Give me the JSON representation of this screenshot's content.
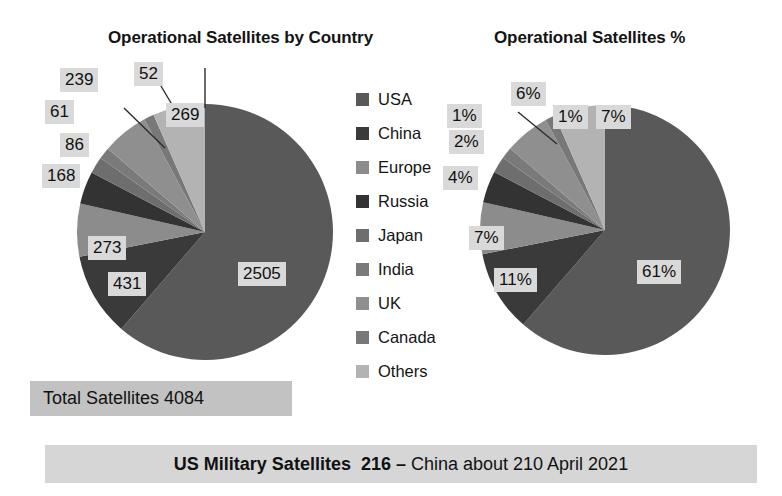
{
  "charts": {
    "left": {
      "title": "Operational Satellites by Country",
      "labels": {
        "usa": "2505",
        "china": "431",
        "europe": "273",
        "russia": "168",
        "japan": "86",
        "india": "61",
        "uk": "239",
        "canada": "52",
        "others": "269"
      }
    },
    "right": {
      "title": "Operational Satellites %",
      "labels": {
        "usa": "61%",
        "china": "11%",
        "europe": "7%",
        "russia": "4%",
        "japan": "2%",
        "india": "1%",
        "uk": "6%",
        "canada": "1%",
        "others": "7%"
      }
    }
  },
  "legend": {
    "items": [
      {
        "label": "USA",
        "color": "#595959"
      },
      {
        "label": "China",
        "color": "#3a3a3a"
      },
      {
        "label": "Europe",
        "color": "#8c8c8c"
      },
      {
        "label": "Russia",
        "color": "#333333"
      },
      {
        "label": "Japan",
        "color": "#6e6e6e"
      },
      {
        "label": "India",
        "color": "#7a7a7a"
      },
      {
        "label": "UK",
        "color": "#8f8f8f"
      },
      {
        "label": "Canada",
        "color": "#787878"
      },
      {
        "label": "Others",
        "color": "#b3b3b3"
      }
    ]
  },
  "banners": {
    "total": "Total Satellites 4084",
    "bottom_bold": "US Military Satellites  216 – ",
    "bottom_regular": "China about 210 April 2021"
  },
  "chart_data": {
    "type": "pie",
    "title": "Operational Satellites by Country",
    "categories": [
      "USA",
      "China",
      "Europe",
      "Russia",
      "Japan",
      "India",
      "UK",
      "Canada",
      "Others"
    ],
    "values": [
      2505,
      431,
      273,
      168,
      86,
      61,
      239,
      52,
      269
    ],
    "percentages": [
      61,
      11,
      7,
      4,
      2,
      1,
      6,
      1,
      7
    ],
    "value_labels": [
      "2505",
      "431",
      "273",
      "168",
      "86",
      "61",
      "239",
      "52",
      "269"
    ],
    "percent_labels": [
      "61%",
      "11%",
      "7%",
      "4%",
      "2%",
      "1%",
      "6%",
      "1%",
      "7%"
    ],
    "colors": [
      "#595959",
      "#3a3a3a",
      "#8c8c8c",
      "#333333",
      "#6e6e6e",
      "#7a7a7a",
      "#8f8f8f",
      "#787878",
      "#b3b3b3"
    ],
    "total": 4084,
    "total_label": "Total Satellites 4084",
    "legend_position": "center",
    "annotations": [
      "Total Satellites 4084",
      "US Military Satellites  216 – China about 210 April 2021"
    ],
    "charts": [
      {
        "title": "Operational Satellites by Country",
        "label_mode": "value"
      },
      {
        "title": "Operational Satellites %",
        "label_mode": "percent"
      }
    ]
  }
}
